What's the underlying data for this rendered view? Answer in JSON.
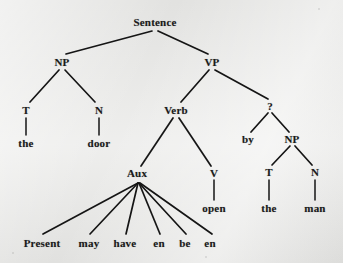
{
  "figure": {
    "type": "syntax-tree",
    "background_color": "#e9e9e7",
    "ink_color": "#151515"
  },
  "nodes": [
    {
      "id": "s",
      "label": "Sentence",
      "x": 155,
      "y": 22,
      "kind": "nonterminal"
    },
    {
      "id": "np1",
      "label": "NP",
      "x": 62,
      "y": 62,
      "kind": "nonterminal"
    },
    {
      "id": "vp",
      "label": "VP",
      "x": 212,
      "y": 62,
      "kind": "nonterminal"
    },
    {
      "id": "t1",
      "label": "T",
      "x": 26,
      "y": 110,
      "kind": "nonterminal"
    },
    {
      "id": "n1",
      "label": "N",
      "x": 99,
      "y": 110,
      "kind": "nonterminal"
    },
    {
      "id": "the1",
      "label": "the",
      "x": 26,
      "y": 143,
      "kind": "terminal"
    },
    {
      "id": "door",
      "label": "door",
      "x": 99,
      "y": 143,
      "kind": "terminal"
    },
    {
      "id": "verb",
      "label": "Verb",
      "x": 176,
      "y": 110,
      "kind": "nonterminal"
    },
    {
      "id": "qmark",
      "label": "?",
      "x": 270,
      "y": 106,
      "kind": "nonterminal"
    },
    {
      "id": "by",
      "label": "by",
      "x": 248,
      "y": 139,
      "kind": "terminal"
    },
    {
      "id": "np2",
      "label": "NP",
      "x": 292,
      "y": 139,
      "kind": "nonterminal"
    },
    {
      "id": "t2",
      "label": "T",
      "x": 269,
      "y": 172,
      "kind": "nonterminal"
    },
    {
      "id": "n2",
      "label": "N",
      "x": 315,
      "y": 172,
      "kind": "nonterminal"
    },
    {
      "id": "the2",
      "label": "the",
      "x": 269,
      "y": 208,
      "kind": "terminal"
    },
    {
      "id": "man",
      "label": "man",
      "x": 315,
      "y": 208,
      "kind": "terminal"
    },
    {
      "id": "aux",
      "label": "Aux",
      "x": 137,
      "y": 173,
      "kind": "nonterminal"
    },
    {
      "id": "v",
      "label": "V",
      "x": 214,
      "y": 173,
      "kind": "nonterminal"
    },
    {
      "id": "open",
      "label": "open",
      "x": 214,
      "y": 208,
      "kind": "terminal"
    },
    {
      "id": "present",
      "label": "Present",
      "x": 42,
      "y": 243,
      "kind": "terminal"
    },
    {
      "id": "may",
      "label": "may",
      "x": 89,
      "y": 243,
      "kind": "terminal"
    },
    {
      "id": "have",
      "label": "have",
      "x": 125,
      "y": 243,
      "kind": "terminal"
    },
    {
      "id": "en1",
      "label": "en",
      "x": 159,
      "y": 243,
      "kind": "terminal"
    },
    {
      "id": "be",
      "label": "be",
      "x": 185,
      "y": 243,
      "kind": "terminal"
    },
    {
      "id": "en2",
      "label": "en",
      "x": 210,
      "y": 243,
      "kind": "terminal"
    }
  ],
  "edges": [
    {
      "from": "s",
      "to": "np1",
      "x1": 152,
      "y1": 31,
      "x2": 66,
      "y2": 54
    },
    {
      "from": "s",
      "to": "vp",
      "x1": 158,
      "y1": 31,
      "x2": 208,
      "y2": 54
    },
    {
      "from": "np1",
      "to": "t1",
      "x1": 59,
      "y1": 70,
      "x2": 30,
      "y2": 102
    },
    {
      "from": "np1",
      "to": "n1",
      "x1": 65,
      "y1": 70,
      "x2": 95,
      "y2": 102
    },
    {
      "from": "t1",
      "to": "the1",
      "x1": 26,
      "y1": 118,
      "x2": 26,
      "y2": 135
    },
    {
      "from": "n1",
      "to": "door",
      "x1": 99,
      "y1": 118,
      "x2": 99,
      "y2": 135
    },
    {
      "from": "vp",
      "to": "verb",
      "x1": 209,
      "y1": 70,
      "x2": 181,
      "y2": 102
    },
    {
      "from": "vp",
      "to": "qmark",
      "x1": 215,
      "y1": 70,
      "x2": 268,
      "y2": 99
    },
    {
      "from": "verb",
      "to": "aux",
      "x1": 173,
      "y1": 118,
      "x2": 141,
      "y2": 166
    },
    {
      "from": "verb",
      "to": "v",
      "x1": 179,
      "y1": 118,
      "x2": 211,
      "y2": 166
    },
    {
      "from": "qmark",
      "to": "by",
      "x1": 268,
      "y1": 113,
      "x2": 251,
      "y2": 132
    },
    {
      "from": "qmark",
      "to": "np2",
      "x1": 272,
      "y1": 113,
      "x2": 289,
      "y2": 132
    },
    {
      "from": "np2",
      "to": "t2",
      "x1": 290,
      "y1": 146,
      "x2": 272,
      "y2": 165
    },
    {
      "from": "np2",
      "to": "n2",
      "x1": 295,
      "y1": 146,
      "x2": 312,
      "y2": 165
    },
    {
      "from": "t2",
      "to": "the2",
      "x1": 269,
      "y1": 180,
      "x2": 269,
      "y2": 200
    },
    {
      "from": "n2",
      "to": "man",
      "x1": 315,
      "y1": 180,
      "x2": 315,
      "y2": 200
    },
    {
      "from": "v",
      "to": "open",
      "x1": 214,
      "y1": 180,
      "x2": 214,
      "y2": 200
    },
    {
      "from": "aux",
      "to": "present",
      "x1": 138,
      "y1": 183,
      "x2": 43,
      "y2": 234
    },
    {
      "from": "aux",
      "to": "may",
      "x1": 138,
      "y1": 183,
      "x2": 90,
      "y2": 234
    },
    {
      "from": "aux",
      "to": "have",
      "x1": 138,
      "y1": 183,
      "x2": 126,
      "y2": 234
    },
    {
      "from": "aux",
      "to": "en1",
      "x1": 139,
      "y1": 183,
      "x2": 160,
      "y2": 234
    },
    {
      "from": "aux",
      "to": "be",
      "x1": 139,
      "y1": 183,
      "x2": 186,
      "y2": 234
    },
    {
      "from": "aux",
      "to": "en2",
      "x1": 140,
      "y1": 183,
      "x2": 212,
      "y2": 234
    }
  ]
}
